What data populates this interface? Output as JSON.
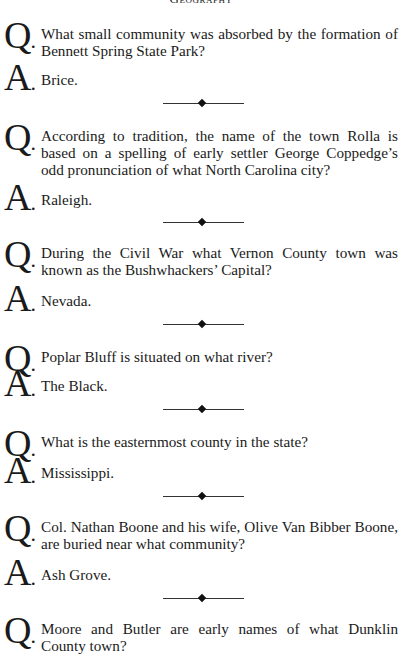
{
  "header": {
    "title": "Geography"
  },
  "labels": {
    "q": "Q",
    "a": "A",
    "dot": "."
  },
  "items": [
    {
      "question": "What small community was absorbed by the formation of Bennett Spring State Park?",
      "answer": "Brice."
    },
    {
      "question": "According to tradition, the name of the town Rolla is based on a spelling of early settler George Coppedge’s odd pronunciation of what North Carolina city?",
      "answer": "Raleigh."
    },
    {
      "question": "During the Civil War what Vernon County town was known as the Bushwhackers’ Capital?",
      "answer": "Nevada."
    },
    {
      "question": "Poplar Bluff is situated on what river?",
      "answer": "The Black."
    },
    {
      "question": "What is the easternmost county in the state?",
      "answer": "Mississippi."
    },
    {
      "question": "Col. Nathan Boone and his wife, Olive Van Bibber Boone, are buried near what community?",
      "answer": "Ash Grove."
    },
    {
      "question": "Moore and Butler are early names of what Dunklin County town?"
    }
  ]
}
